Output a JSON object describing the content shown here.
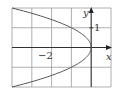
{
  "chart_data": {
    "type": "line",
    "title": "",
    "xlabel": "x",
    "ylabel": "y",
    "xlim": [
      -4,
      1
    ],
    "ylim": [
      -2,
      2
    ],
    "grid": true,
    "grid_step": 1,
    "tick_labels": {
      "x": [
        {
          "value": -2,
          "label": "−2"
        }
      ],
      "y": [
        {
          "value": 1,
          "label": "1"
        }
      ]
    },
    "series": [
      {
        "name": "x = -y^2",
        "equation": "x = -y^2",
        "points": [
          {
            "x": -4,
            "y": -2
          },
          {
            "x": -2.25,
            "y": -1.5
          },
          {
            "x": -1,
            "y": -1
          },
          {
            "x": -0.25,
            "y": -0.5
          },
          {
            "x": 0,
            "y": 0
          },
          {
            "x": -0.25,
            "y": 0.5
          },
          {
            "x": -1,
            "y": 1
          },
          {
            "x": -2.25,
            "y": 1.5
          },
          {
            "x": -4,
            "y": 2
          }
        ]
      }
    ],
    "legend": "none"
  },
  "labels": {
    "x_axis": "x",
    "y_axis": "y",
    "tick_x_neg2": "−2",
    "tick_y_1": "1"
  },
  "colors": {
    "grid": "#9a9a9a",
    "axis": "#222222",
    "curve": "#555555",
    "background": "#ffffff"
  }
}
